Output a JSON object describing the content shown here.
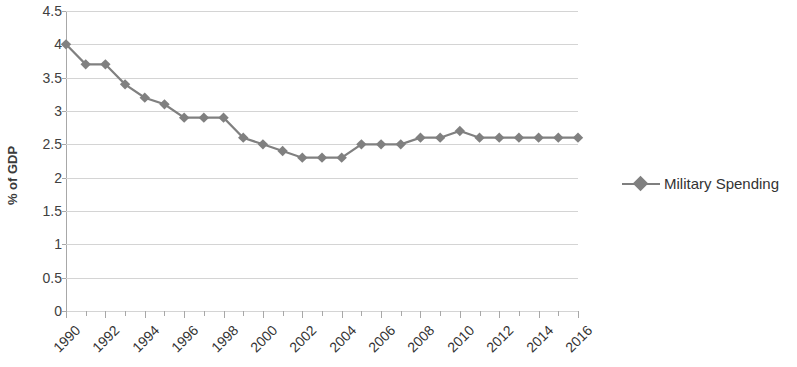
{
  "chart_data": {
    "type": "line",
    "title": "",
    "xlabel": "",
    "ylabel": "% of GDP",
    "ylim": [
      0,
      4.5
    ],
    "ytick_step": 0.5,
    "yticks": [
      "0",
      "0.5",
      "1",
      "1.5",
      "2",
      "2.5",
      "3",
      "3.5",
      "4",
      "4.5"
    ],
    "xlim": [
      1990,
      2016
    ],
    "xticks": [
      "1990",
      "1992",
      "1994",
      "1996",
      "1998",
      "2000",
      "2002",
      "2004",
      "2006",
      "2008",
      "2010",
      "2012",
      "2014",
      "2016"
    ],
    "xtick_step": 2,
    "grid": true,
    "grid_axis": "y",
    "legend_position": "right",
    "x": [
      1990,
      1991,
      1992,
      1993,
      1994,
      1995,
      1996,
      1997,
      1998,
      1999,
      2000,
      2001,
      2002,
      2003,
      2004,
      2005,
      2006,
      2007,
      2008,
      2009,
      2010,
      2011,
      2012,
      2013,
      2014,
      2015,
      2016
    ],
    "series": [
      {
        "name": "Military Spending",
        "color": "#808080",
        "marker": "diamond",
        "values": [
          4.0,
          3.7,
          3.7,
          3.4,
          3.2,
          3.1,
          2.9,
          2.9,
          2.9,
          2.6,
          2.5,
          2.4,
          2.3,
          2.3,
          2.3,
          2.5,
          2.5,
          2.5,
          2.6,
          2.6,
          2.7,
          2.6,
          2.6,
          2.6,
          2.6,
          2.6,
          2.6
        ]
      }
    ]
  },
  "legend": {
    "entries": [
      {
        "label": "Military Spending"
      }
    ]
  },
  "axis": {
    "y_title": "% of GDP"
  },
  "colors": {
    "series": "#808080",
    "gridline": "#d4d4d4",
    "axis": "#a8a8a8",
    "text": "#333333"
  }
}
